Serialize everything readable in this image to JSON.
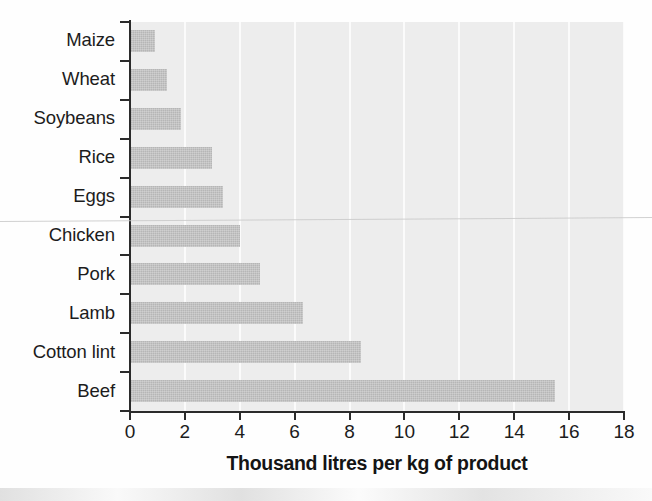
{
  "chart_data": {
    "type": "bar",
    "orientation": "horizontal",
    "title": "",
    "subtitle": "",
    "xlabel": "Thousand litres per kg of product",
    "ylabel": "",
    "categories": [
      "Maize",
      "Wheat",
      "Soybeans",
      "Rice",
      "Eggs",
      "Chicken",
      "Pork",
      "Lamb",
      "Cotton lint",
      "Beef"
    ],
    "values": [
      0.9,
      1.35,
      1.85,
      3.0,
      3.4,
      4.0,
      4.75,
      6.3,
      8.4,
      15.5
    ],
    "series": [
      {
        "name": "Water footprint",
        "values": [
          0.9,
          1.35,
          1.85,
          3.0,
          3.4,
          4.0,
          4.75,
          6.3,
          8.4,
          15.5
        ]
      }
    ],
    "xlim": [
      0,
      18
    ],
    "x_ticks": [
      "0",
      "2",
      "4",
      "6",
      "8",
      "10",
      "12",
      "14",
      "16",
      "18"
    ],
    "x_tick_values": [
      0,
      2,
      4,
      6,
      8,
      10,
      12,
      14,
      16,
      18
    ],
    "x_tick_step": 2,
    "grid": "vertical",
    "legend": "none",
    "colors": {
      "bar_fill": "#b6b6b6",
      "plot_background": "#ededed",
      "gridline": "#fbfbfb",
      "axis": "#2b2b2b",
      "text": "#1c1c1c",
      "figure_background": "#fefefe"
    }
  }
}
